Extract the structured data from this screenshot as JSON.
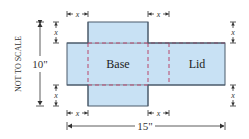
{
  "diagram": {
    "note": "NOT TO SCALE",
    "height_label": "10\"",
    "width_label": "15\"",
    "cut_label": "x",
    "regions": {
      "base": "Base",
      "lid": "Lid"
    },
    "colors": {
      "fill": "#c8e1f4",
      "outline": "#4a5a6a",
      "fold_line": "#b8476a",
      "dimension": "#333333"
    }
  }
}
